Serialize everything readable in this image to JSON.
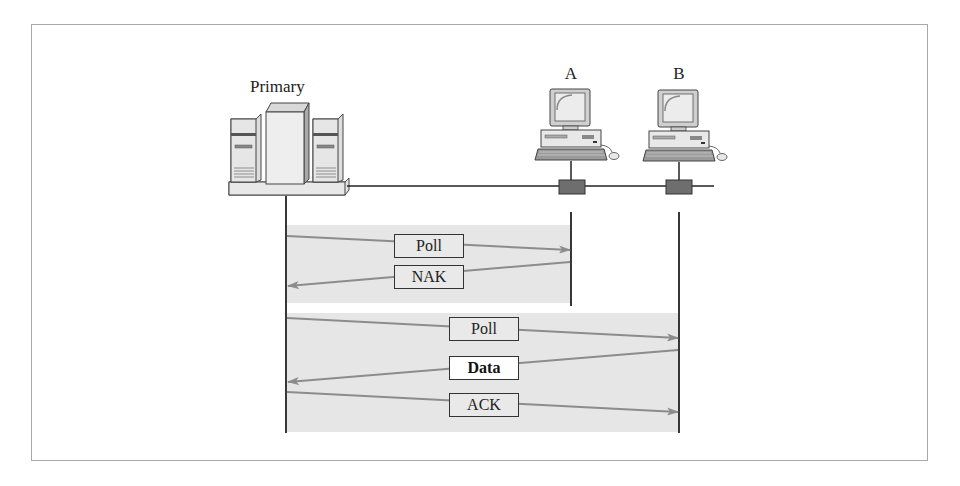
{
  "diagram": {
    "title_labels": {
      "primary": "Primary",
      "station_a": "A",
      "station_b": "B"
    },
    "exchange_1": {
      "target": "A",
      "messages": [
        {
          "label": "Poll",
          "direction": "primary-to-A"
        },
        {
          "label": "NAK",
          "direction": "A-to-primary"
        }
      ]
    },
    "exchange_2": {
      "target": "B",
      "messages": [
        {
          "label": "Poll",
          "direction": "primary-to-B"
        },
        {
          "label": "Data",
          "direction": "B-to-primary",
          "emphasis": "bold"
        },
        {
          "label": "ACK",
          "direction": "primary-to-B"
        }
      ]
    },
    "colors": {
      "frame": "#a8a8a8",
      "shade": "#e6e6e6",
      "arrow": "#8c8c8c",
      "line": "#222222"
    }
  }
}
